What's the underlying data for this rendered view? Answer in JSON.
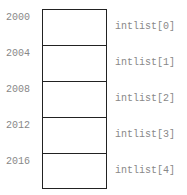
{
  "diagram": {
    "title": "",
    "cells": [
      {
        "address": "2000",
        "label": "intlist[0]"
      },
      {
        "address": "2004",
        "label": "intlist[1]"
      },
      {
        "address": "2008",
        "label": "intlist[2]"
      },
      {
        "address": "2012",
        "label": "intlist[3]"
      },
      {
        "address": "2016",
        "label": "intlist[4]"
      }
    ]
  }
}
